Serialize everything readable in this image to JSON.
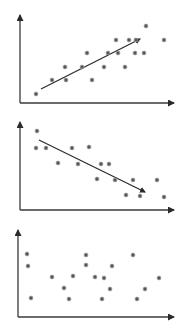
{
  "colors": {
    "axis": "#3a3a3a",
    "point_fill": "#555555",
    "point_stroke": "#9a9a9a",
    "trend": "#2a2a2a",
    "background": "#ffffff"
  },
  "chart_data": [
    {
      "type": "scatter",
      "title": "",
      "xlabel": "",
      "ylabel": "",
      "description": "Positive correlation",
      "grid": false,
      "legend": null,
      "trend_arrow": {
        "from": [
          41,
          89
        ],
        "to": [
          140,
          39
        ],
        "direction": "up"
      },
      "axes": {
        "origin": [
          20,
          103
        ],
        "x_end": [
          176,
          103
        ],
        "y_end": [
          20,
          13
        ]
      },
      "points": [
        [
          36,
          94
        ],
        [
          52,
          80
        ],
        [
          66,
          80
        ],
        [
          65,
          67
        ],
        [
          82,
          67
        ],
        [
          87,
          53
        ],
        [
          92,
          80
        ],
        [
          104,
          67
        ],
        [
          108,
          53
        ],
        [
          116,
          40
        ],
        [
          118,
          53
        ],
        [
          125,
          67
        ],
        [
          129,
          40
        ],
        [
          135,
          53
        ],
        [
          136,
          40
        ],
        [
          144,
          53
        ],
        [
          146,
          26
        ],
        [
          164,
          40
        ]
      ]
    },
    {
      "type": "scatter",
      "title": "",
      "xlabel": "",
      "ylabel": "",
      "description": "Negative correlation",
      "grid": false,
      "legend": null,
      "trend_arrow": {
        "from": [
          39,
          140
        ],
        "to": [
          145,
          192
        ],
        "direction": "down"
      },
      "axes": {
        "origin": [
          20,
          210
        ],
        "x_end": [
          176,
          210
        ],
        "y_end": [
          20,
          120
        ]
      },
      "points": [
        [
          37,
          131
        ],
        [
          36,
          148
        ],
        [
          46,
          148
        ],
        [
          58,
          163
        ],
        [
          72,
          148
        ],
        [
          78,
          164
        ],
        [
          89,
          147
        ],
        [
          97,
          179
        ],
        [
          101,
          164
        ],
        [
          109,
          164
        ],
        [
          115,
          180
        ],
        [
          126,
          195
        ],
        [
          133,
          180
        ],
        [
          140,
          196
        ],
        [
          157,
          180
        ],
        [
          164,
          197
        ]
      ]
    },
    {
      "type": "scatter",
      "title": "",
      "xlabel": "",
      "ylabel": "",
      "description": "No correlation",
      "grid": false,
      "legend": null,
      "trend_arrow": null,
      "axes": {
        "origin": [
          18,
          317
        ],
        "x_end": [
          176,
          317
        ],
        "y_end": [
          18,
          228
        ]
      },
      "points": [
        [
          27,
          254
        ],
        [
          28,
          266
        ],
        [
          31,
          298
        ],
        [
          52,
          277
        ],
        [
          64,
          288
        ],
        [
          69,
          299
        ],
        [
          73,
          276
        ],
        [
          86,
          255
        ],
        [
          86,
          265
        ],
        [
          95,
          277
        ],
        [
          102,
          299
        ],
        [
          104,
          278
        ],
        [
          110,
          289
        ],
        [
          112,
          266
        ],
        [
          133,
          255
        ],
        [
          137,
          299
        ],
        [
          145,
          289
        ],
        [
          159,
          278
        ]
      ]
    }
  ]
}
